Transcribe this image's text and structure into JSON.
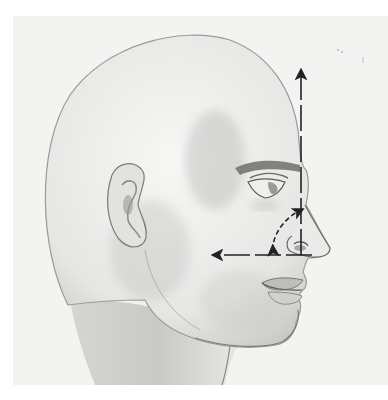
{
  "figure": {
    "annotation": "Nasolabial angle",
    "background_color": "#f3f3f2",
    "line_color": "#222222",
    "skin_shade_color": "#8c8c8c"
  },
  "arrows": [
    {
      "name": "vertical-arrow",
      "direction": "up",
      "style": "dashed",
      "x": 301,
      "y_from": 255,
      "y_to": 72
    },
    {
      "name": "horizontal-arrow",
      "direction": "left",
      "style": "dashed",
      "y": 255,
      "x_from": 312,
      "x_to": 215
    },
    {
      "name": "angle-arc-arrow",
      "direction": "both",
      "style": "dashed",
      "from": [
        272,
        250
      ],
      "to": [
        300,
        210
      ]
    }
  ]
}
